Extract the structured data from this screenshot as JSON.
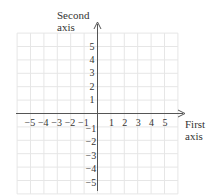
{
  "diagram": {
    "type": "coordinate-plane",
    "y_axis_label": [
      "Second",
      "axis"
    ],
    "x_axis_label": [
      "First",
      "axis"
    ],
    "x_ticks_negative": [
      "−5",
      "−4",
      "−3",
      "−2",
      "−1"
    ],
    "x_ticks_positive": [
      "1",
      "2",
      "3",
      "4",
      "5"
    ],
    "y_ticks_positive": [
      "5",
      "4",
      "3",
      "2",
      "1"
    ],
    "y_ticks_negative": [
      "−1",
      "−2",
      "−3",
      "−4",
      "−5"
    ],
    "x_range": [
      -6,
      6
    ],
    "y_range": [
      -6,
      6
    ],
    "grid": true,
    "colors": {
      "grid": "#e4e4e4",
      "axis": "#555555",
      "text": "#333333"
    }
  }
}
